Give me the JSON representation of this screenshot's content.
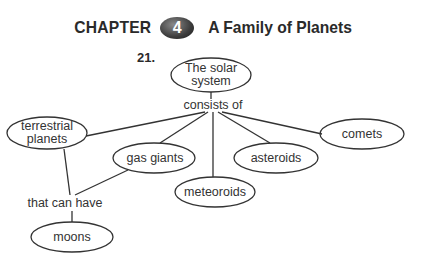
{
  "header": {
    "chapter_word": "CHAPTER",
    "chapter_number": "4",
    "chapter_title": "A Family of Planets"
  },
  "question_number": "21.",
  "concept_map": {
    "root": {
      "line1": "The solar",
      "line2": "system"
    },
    "link_consists": "consists of",
    "nodes": {
      "terrestrial": {
        "line1": "terrestrial",
        "line2": "planets"
      },
      "gas_giants": "gas giants",
      "meteoroids": "meteoroids",
      "asteroids": "asteroids",
      "comets": "comets",
      "moons": "moons"
    },
    "link_can_have": "that can have"
  }
}
